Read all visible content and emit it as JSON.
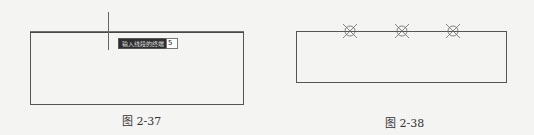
{
  "figures": [
    {
      "caption": "图 2-37",
      "tooltip": {
        "prompt": "输入线段的终端",
        "input_value": "5"
      }
    },
    {
      "caption": "图 2-38",
      "lamps": [
        {
          "cx": 350
        },
        {
          "cx": 402
        },
        {
          "cx": 453
        }
      ]
    }
  ]
}
